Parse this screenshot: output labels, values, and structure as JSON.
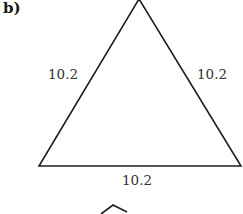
{
  "figure": {
    "label": "b)",
    "shape": "equilateral-triangle",
    "sides": {
      "left": "10.2",
      "right": "10.2",
      "bottom": "10.2"
    },
    "stroke_color": "#1f1f1f",
    "next_figure_partial": "pentagon-apex"
  }
}
